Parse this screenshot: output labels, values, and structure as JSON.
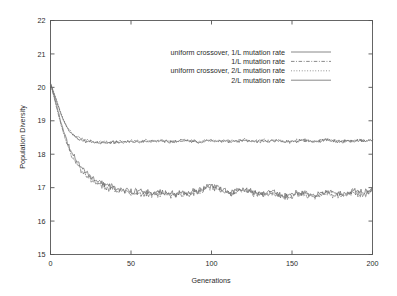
{
  "chart_data": {
    "type": "line",
    "title": "",
    "xlabel": "Generations",
    "ylabel": "Population Diversity",
    "xlim": [
      0,
      200
    ],
    "ylim": [
      15,
      22
    ],
    "xticks": [
      0,
      50,
      100,
      150,
      200
    ],
    "yticks": [
      15,
      16,
      17,
      18,
      19,
      20,
      21,
      22
    ],
    "grid": false,
    "legend_position": "upper-center",
    "x": [
      0,
      2,
      4,
      6,
      8,
      10,
      12,
      14,
      16,
      18,
      20,
      24,
      28,
      32,
      36,
      40,
      44,
      48,
      52,
      56,
      60,
      64,
      68,
      72,
      76,
      80,
      84,
      88,
      92,
      96,
      100,
      104,
      108,
      112,
      116,
      120,
      124,
      128,
      132,
      136,
      140,
      144,
      148,
      152,
      156,
      160,
      164,
      168,
      172,
      176,
      180,
      184,
      188,
      192,
      196,
      200
    ],
    "series": [
      {
        "name": "uniform crossover, 1/L mutation rate",
        "style": "solid",
        "color": "#6b6b6b",
        "values": [
          20.12,
          19.78,
          19.42,
          19.05,
          18.72,
          18.42,
          18.18,
          17.98,
          17.82,
          17.68,
          17.56,
          17.38,
          17.24,
          17.14,
          17.06,
          17.0,
          16.95,
          16.91,
          16.87,
          16.9,
          16.86,
          16.83,
          16.88,
          16.84,
          16.8,
          16.86,
          16.83,
          16.88,
          16.92,
          17.0,
          17.05,
          16.98,
          16.9,
          16.86,
          16.93,
          16.97,
          16.9,
          16.85,
          16.82,
          16.88,
          16.84,
          16.8,
          16.77,
          16.82,
          16.86,
          16.82,
          16.78,
          16.83,
          16.88,
          16.84,
          16.8,
          16.85,
          16.9,
          16.86,
          16.88,
          16.92
        ]
      },
      {
        "name": "1/L mutation rate",
        "style": "dashdot",
        "color": "#6b6b6b",
        "values": [
          20.1,
          19.74,
          19.36,
          18.98,
          18.64,
          18.34,
          18.1,
          17.9,
          17.74,
          17.6,
          17.48,
          17.3,
          17.16,
          17.06,
          16.98,
          16.93,
          16.88,
          16.84,
          16.81,
          16.84,
          16.8,
          16.78,
          16.83,
          16.79,
          16.76,
          16.81,
          16.78,
          16.84,
          16.89,
          16.97,
          17.02,
          16.94,
          16.86,
          16.81,
          16.88,
          16.92,
          16.85,
          16.8,
          16.77,
          16.83,
          16.79,
          16.75,
          16.72,
          16.77,
          16.81,
          16.77,
          16.73,
          16.78,
          16.83,
          16.79,
          16.75,
          16.8,
          16.85,
          16.81,
          16.83,
          16.88
        ]
      },
      {
        "name": "uniform crossover, 2/L mutation rate",
        "style": "dotted",
        "color": "#8a8a8a",
        "values": [
          20.12,
          19.86,
          19.58,
          19.3,
          19.04,
          18.84,
          18.7,
          18.6,
          18.53,
          18.48,
          18.44,
          18.4,
          18.38,
          18.37,
          18.36,
          18.38,
          18.37,
          18.39,
          18.4,
          18.38,
          18.41,
          18.39,
          18.42,
          18.4,
          18.38,
          18.41,
          18.43,
          18.4,
          18.38,
          18.41,
          18.43,
          18.4,
          18.42,
          18.39,
          18.41,
          18.44,
          18.41,
          18.39,
          18.42,
          18.4,
          18.43,
          18.41,
          18.38,
          18.4,
          18.43,
          18.41,
          18.39,
          18.42,
          18.44,
          18.41,
          18.39,
          18.42,
          18.4,
          18.43,
          18.41,
          18.44
        ]
      },
      {
        "name": "2/L mutation rate",
        "style": "solid-light",
        "color": "#9a9a9a",
        "values": [
          20.11,
          19.84,
          19.55,
          19.27,
          19.01,
          18.81,
          18.67,
          18.57,
          18.5,
          18.45,
          18.41,
          18.37,
          18.35,
          18.34,
          18.34,
          18.36,
          18.35,
          18.37,
          18.38,
          18.36,
          18.39,
          18.37,
          18.4,
          18.38,
          18.36,
          18.39,
          18.41,
          18.38,
          18.36,
          18.39,
          18.41,
          18.38,
          18.4,
          18.37,
          18.39,
          18.42,
          18.39,
          18.37,
          18.4,
          18.38,
          18.41,
          18.39,
          18.36,
          18.38,
          18.41,
          18.39,
          18.37,
          18.4,
          18.42,
          18.39,
          18.37,
          18.4,
          18.38,
          18.41,
          18.39,
          18.42
        ]
      }
    ]
  }
}
